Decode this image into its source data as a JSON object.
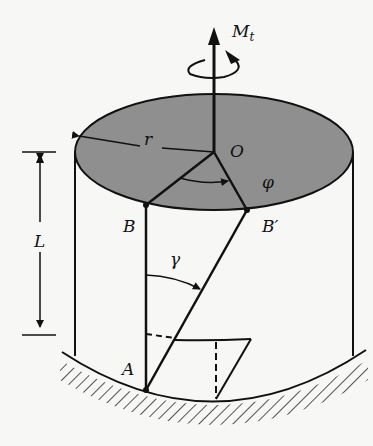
{
  "diagram": {
    "type": "torsion-cylinder",
    "labels": {
      "torque": "M",
      "torque_sub": "t",
      "radius": "r",
      "center": "O",
      "twist_angle": "φ",
      "point_b": "B",
      "point_b_prime": "B′",
      "shear_strain": "γ",
      "length": "L",
      "point_a": "A"
    },
    "colors": {
      "top_face": "#8f8f8f",
      "stroke": "#111111",
      "background": "#f7f7f5"
    }
  }
}
